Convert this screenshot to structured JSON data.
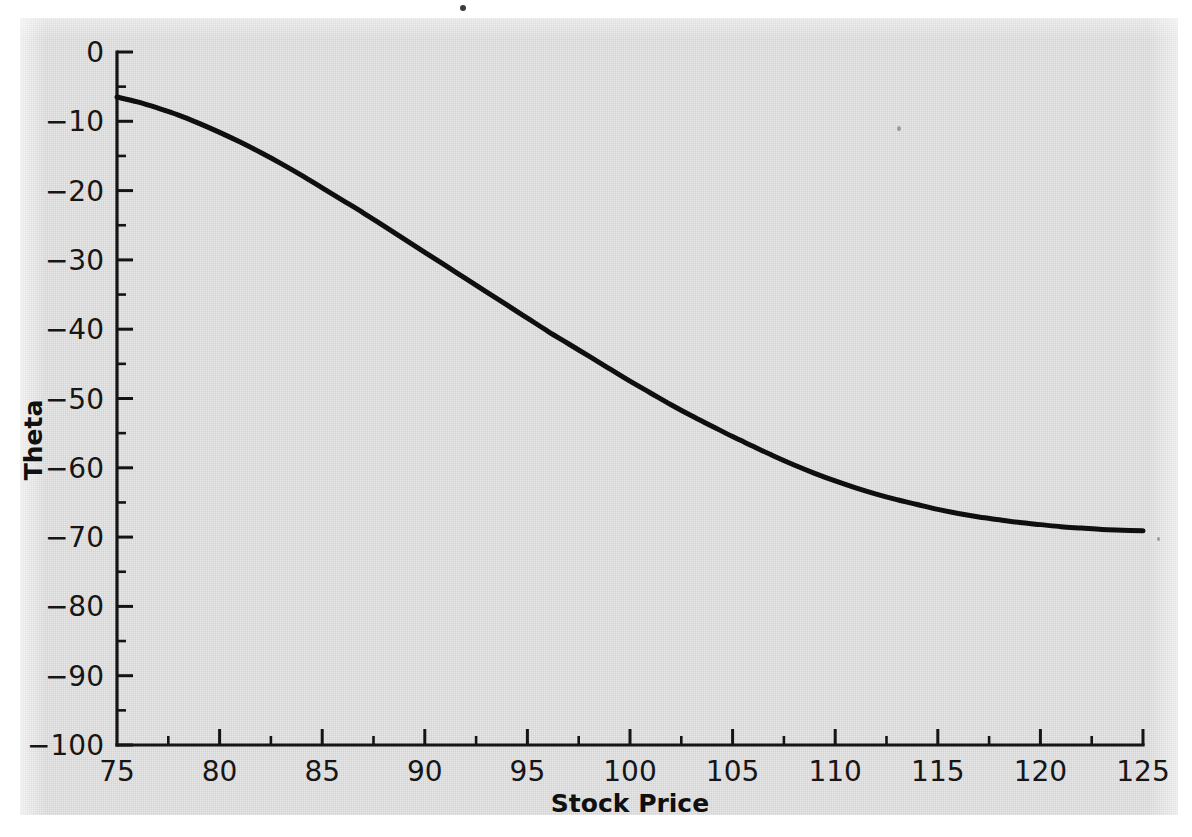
{
  "figure": {
    "background_color": "#ffffff",
    "paper_color": "#d9d9d9",
    "curve_color": "#0f0f0f",
    "axis_color": "#141414"
  },
  "chart_data": {
    "type": "line",
    "title": "",
    "subtitle": "",
    "xlabel": "Stock Price",
    "ylabel": "Theta",
    "xlim": [
      75,
      125
    ],
    "ylim": [
      -100,
      0
    ],
    "grid": false,
    "legend": null,
    "x_ticks": [
      75,
      80,
      85,
      90,
      95,
      100,
      105,
      110,
      115,
      120,
      125
    ],
    "x_tick_labels": [
      "75",
      "80",
      "85",
      "90",
      "95",
      "100",
      "105",
      "110",
      "115",
      "120",
      "125"
    ],
    "x_minor_tick_interval": 2.5,
    "y_ticks": [
      0,
      -10,
      -20,
      -30,
      -40,
      -50,
      -60,
      -70,
      -80,
      -90,
      -100
    ],
    "y_tick_labels": [
      "0",
      "−10",
      "−20",
      "−30",
      "−40",
      "−50",
      "−60",
      "−70",
      "−80",
      "−90",
      "−100"
    ],
    "y_minor_tick_interval": 5,
    "series": [
      {
        "name": "Theta",
        "x": [
          75,
          76,
          77,
          78,
          79,
          80,
          81,
          82,
          83,
          84,
          85,
          86,
          87,
          88,
          89,
          90,
          91,
          92,
          93,
          94,
          95,
          96,
          97,
          98,
          99,
          100,
          101,
          102,
          103,
          104,
          105,
          106,
          107,
          108,
          109,
          110,
          111,
          112,
          113,
          114,
          115,
          116,
          117,
          118,
          119,
          120,
          121,
          122,
          123,
          124,
          125
        ],
        "values": [
          -6.5,
          -7.2,
          -8.1,
          -9.1,
          -10.3,
          -11.6,
          -13.0,
          -14.5,
          -16.1,
          -17.8,
          -19.6,
          -21.4,
          -23.2,
          -25.1,
          -27.0,
          -28.9,
          -30.8,
          -32.7,
          -34.6,
          -36.5,
          -38.4,
          -40.3,
          -42.1,
          -43.9,
          -45.7,
          -47.5,
          -49.2,
          -50.9,
          -52.5,
          -54.0,
          -55.5,
          -56.9,
          -58.3,
          -59.6,
          -60.8,
          -61.9,
          -62.9,
          -63.8,
          -64.6,
          -65.3,
          -66.0,
          -66.6,
          -67.1,
          -67.5,
          -67.9,
          -68.2,
          -68.5,
          -68.7,
          -68.9,
          -69.0,
          -69.1
        ]
      }
    ],
    "annotations": []
  },
  "axis_titles": {
    "x": "Stock Price",
    "y": "Theta"
  }
}
